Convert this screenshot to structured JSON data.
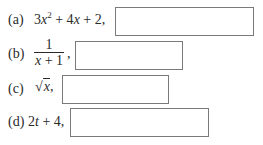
{
  "items": [
    {
      "label": "(a)",
      "expr_parts": [
        "3",
        "x",
        "2",
        " + 4",
        "x",
        " + 2,"
      ],
      "answer": ""
    },
    {
      "label": "(b)",
      "numerator": "1",
      "denominator_var": "x",
      "denominator_rest": " + 1",
      "suffix": ",",
      "answer": ""
    },
    {
      "label": "(c)",
      "radical_symbol": "√",
      "radicand": "x",
      "suffix": ",",
      "answer": ""
    },
    {
      "label": "(d)",
      "expr_parts": [
        "2",
        "t",
        " + 4,"
      ],
      "answer": ""
    }
  ]
}
